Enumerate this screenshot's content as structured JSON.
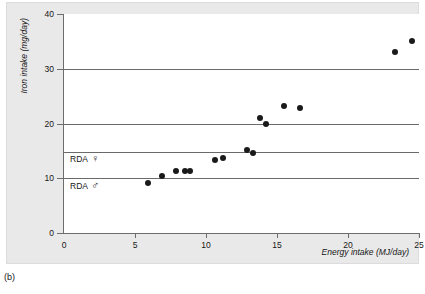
{
  "caption": "(b)",
  "chart_data": {
    "type": "scatter",
    "title": "",
    "xlabel": "Energy intake (MJ/day)",
    "ylabel": "Iron intake (mg/day)",
    "xlim": [
      0,
      25
    ],
    "ylim": [
      0,
      40
    ],
    "xticks": [
      0,
      5,
      10,
      15,
      20,
      25
    ],
    "yticks": [
      0,
      10,
      20,
      30,
      40
    ],
    "grid": false,
    "legend": "none",
    "marker_color": "#1a1a1a",
    "reference_line_color": "#6a6a6a",
    "points": [
      {
        "x": 5.9,
        "y": 9.2
      },
      {
        "x": 6.9,
        "y": 10.4
      },
      {
        "x": 7.9,
        "y": 11.4
      },
      {
        "x": 8.5,
        "y": 11.4
      },
      {
        "x": 8.9,
        "y": 11.4
      },
      {
        "x": 10.6,
        "y": 13.3
      },
      {
        "x": 11.2,
        "y": 13.7
      },
      {
        "x": 12.9,
        "y": 15.2
      },
      {
        "x": 13.3,
        "y": 14.6
      },
      {
        "x": 13.8,
        "y": 21.0
      },
      {
        "x": 14.2,
        "y": 20.0
      },
      {
        "x": 15.5,
        "y": 23.2
      },
      {
        "x": 16.6,
        "y": 22.9
      },
      {
        "x": 23.3,
        "y": 33.0
      },
      {
        "x": 24.5,
        "y": 35.0
      }
    ],
    "reference_lines": [
      {
        "y": 30,
        "label": "",
        "symbol": ""
      },
      {
        "y": 20,
        "label": "",
        "symbol": ""
      },
      {
        "y": 14.8,
        "label": "RDA",
        "symbol": "♀"
      },
      {
        "y": 10,
        "label": "RDA",
        "symbol": "♂"
      }
    ],
    "annotations": [
      {
        "text": "RDA",
        "symbol": "♀",
        "y": 14.8
      },
      {
        "text": "RDA",
        "symbol": "♂",
        "y": 10
      }
    ]
  }
}
